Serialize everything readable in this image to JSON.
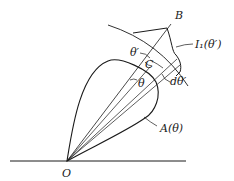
{
  "diagram": {
    "type": "radiation-geometry",
    "labels": {
      "origin": "O",
      "point_b": "B",
      "incident_intensity": "I₁(θ′)",
      "theta_prime": "θ′",
      "center": "C",
      "theta": "θ",
      "d_theta_prime": "dθ′",
      "lobe": "A(θ)"
    },
    "colors": {
      "line": "#1a1a1a",
      "background": "#ffffff"
    }
  }
}
